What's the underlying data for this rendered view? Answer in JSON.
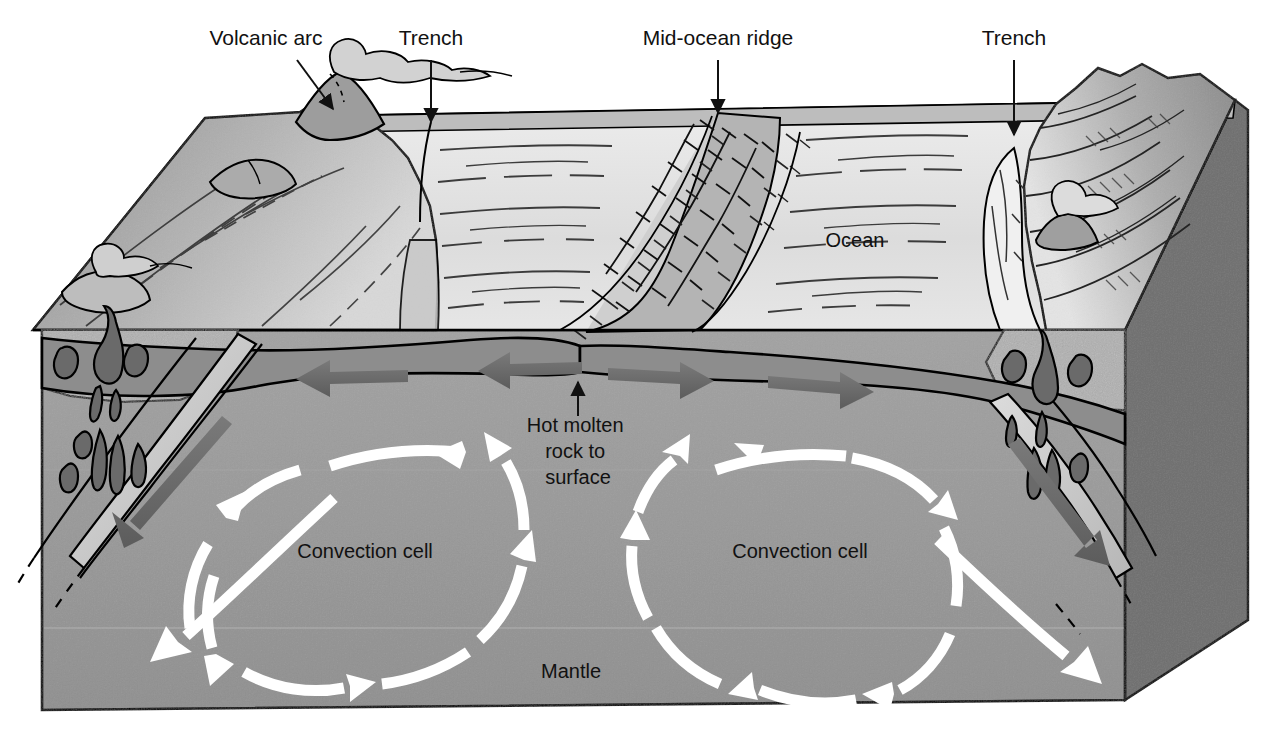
{
  "figure": {
    "background_color": "#ffffff"
  },
  "callout_labels": [
    {
      "id": "volcanic-arc",
      "text": "Volcanic arc",
      "x": 266,
      "y": 45,
      "anchor": "middle",
      "leader": {
        "type": "arrow",
        "x1": 297,
        "y1": 60,
        "x2": 333,
        "y2": 109
      }
    },
    {
      "id": "trench-left",
      "text": "Trench",
      "x": 431,
      "y": 45,
      "anchor": "middle",
      "leader": {
        "type": "arrow",
        "x1": 431,
        "y1": 60,
        "x2": 431,
        "y2": 122
      }
    },
    {
      "id": "mid-ocean-ridge",
      "text": "Mid-ocean ridge",
      "x": 718,
      "y": 45,
      "anchor": "middle",
      "leader": {
        "type": "arrow",
        "x1": 718,
        "y1": 60,
        "x2": 718,
        "y2": 113
      }
    },
    {
      "id": "trench-right",
      "text": "Trench",
      "x": 1014,
      "y": 45,
      "anchor": "middle",
      "leader": {
        "type": "arrow",
        "x1": 1014,
        "y1": 60,
        "x2": 1014,
        "y2": 135
      }
    }
  ],
  "inner_labels": [
    {
      "id": "ocean",
      "text": "Ocean",
      "x": 855,
      "y": 247,
      "color": "#111111"
    },
    {
      "id": "hot-molten-rock",
      "lines": [
        "Hot molten",
        "rock to",
        "surface"
      ],
      "x": 578,
      "y": 432,
      "line_height": 26,
      "color": "#111111",
      "leader": {
        "type": "arrow",
        "x1": 578,
        "y1": 416,
        "x2": 578,
        "y2": 382
      }
    },
    {
      "id": "convection-cell-left",
      "text": "Convection cell",
      "x": 365,
      "y": 558,
      "color": "#111111"
    },
    {
      "id": "convection-cell-right",
      "text": "Convection cell",
      "x": 800,
      "y": 558,
      "color": "#111111"
    },
    {
      "id": "mantle",
      "text": "Mantle",
      "x": 571,
      "y": 678,
      "color": "#111111"
    }
  ],
  "palette": {
    "outline": "#000000",
    "ocean_floor_light": "#e2e2e2",
    "ocean_floor_mid": "#cfcfcf",
    "continent_mid": "#9a9a9a",
    "continent_dark": "#6f6f6f",
    "crust_speckle": "#a9a9a9",
    "lithosphere": "#8a8a8a",
    "mantle_front": "#9c9c9c",
    "mantle_side": "#707070",
    "slab_light": "#c9c9c9",
    "gray_arrow": "#676767",
    "white_arrow": "#ffffff"
  },
  "flow_arrows": {
    "plate_motion": [
      {
        "id": "plate-arrow-left-outer",
        "direction": "left"
      },
      {
        "id": "plate-arrow-left-inner",
        "direction": "left"
      },
      {
        "id": "plate-arrow-right-inner",
        "direction": "right"
      },
      {
        "id": "plate-arrow-right-outer",
        "direction": "right"
      }
    ],
    "subduction": [
      {
        "id": "subduction-arrow-left",
        "direction": "down-left"
      },
      {
        "id": "subduction-arrow-right",
        "direction": "down-right"
      }
    ],
    "convection": [
      {
        "id": "convection-left",
        "rotation": "counter-clockwise",
        "segments": 8
      },
      {
        "id": "convection-right",
        "rotation": "clockwise",
        "segments": 8
      }
    ],
    "descending_white": [
      {
        "id": "descent-arrow-left",
        "direction": "down-left"
      },
      {
        "id": "descent-arrow-right",
        "direction": "down-right"
      }
    ]
  }
}
